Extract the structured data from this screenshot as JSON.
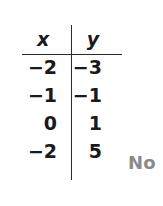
{
  "figure": {
    "type": "value-table",
    "columns": [
      {
        "key": "x",
        "header": "x"
      },
      {
        "key": "y",
        "header": "y"
      }
    ],
    "rows": [
      {
        "x": "−2",
        "y": "−3"
      },
      {
        "x": "−1",
        "y": "−1"
      },
      {
        "x": "0",
        "y": "1"
      },
      {
        "x": "−2",
        "y": "5"
      }
    ],
    "annotation": {
      "text": "No",
      "color": "#8a8a8a"
    },
    "style": {
      "background": "#ffffff",
      "text_color": "#1a1a1a",
      "rule_color": "#2b2b2b"
    }
  },
  "chart_data": {
    "type": "table",
    "title": "",
    "columns": [
      "x",
      "y"
    ],
    "x": [
      "−2",
      "−1",
      "0",
      "−2"
    ],
    "values": [
      "−3",
      "−1",
      "1",
      "5"
    ],
    "rows": [
      [
        "−2",
        "−3"
      ],
      [
        "−1",
        "−1"
      ],
      [
        "0",
        "1"
      ],
      [
        "−2",
        "5"
      ]
    ],
    "annotations": [
      "No"
    ]
  }
}
